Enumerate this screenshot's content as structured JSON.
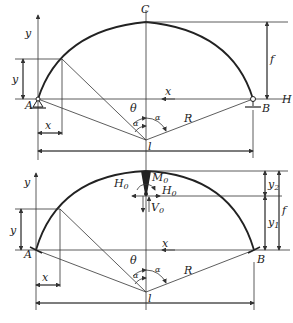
{
  "top_diagram": {
    "labels": {
      "crown": "C",
      "left_support": "A",
      "right_support": "B",
      "horizontal_thrust": "H",
      "y_axis": "y",
      "x_axis": "x",
      "y_ordinate": "y",
      "x_abscissa": "x",
      "rise": "f",
      "radius": "R",
      "angle_theta": "θ",
      "angle_alpha_left": "α",
      "angle_alpha_right": "α",
      "span": "l"
    }
  },
  "bottom_diagram": {
    "labels": {
      "left_support": "A",
      "right_support": "B",
      "crown_moment": "M",
      "crown_moment_sub": "0",
      "crown_thrust_left": "H",
      "crown_thrust_left_sub": "0",
      "crown_thrust_right": "H",
      "crown_thrust_right_sub": "0",
      "crown_shear": "V",
      "crown_shear_sub": "0",
      "y_axis": "y",
      "x_axis": "x",
      "y_ordinate": "y",
      "x_abscissa": "x",
      "rise": "f",
      "y1": "y",
      "y1_sub": "1",
      "y2": "y",
      "y2_sub": "2",
      "radius": "R",
      "angle_theta": "θ",
      "angle_alpha_left": "α",
      "angle_alpha_right": "α",
      "span": "l"
    }
  }
}
